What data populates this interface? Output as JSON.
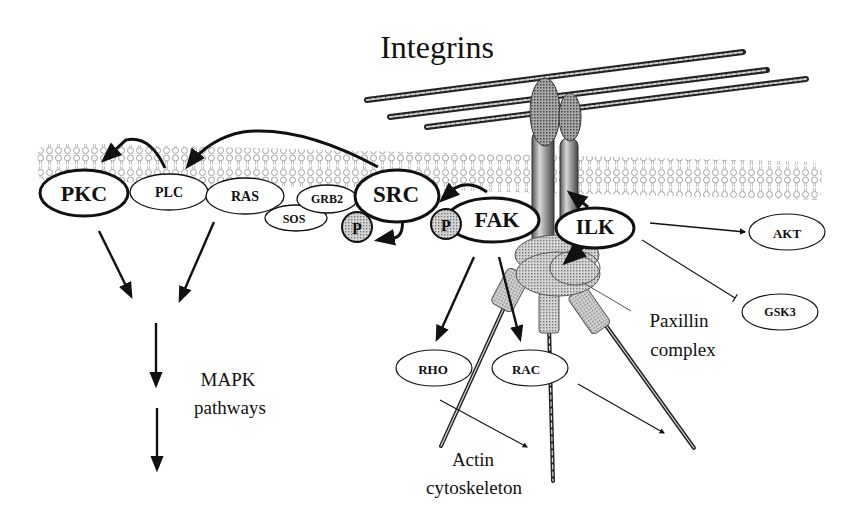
{
  "title": "Integrins",
  "colors": {
    "ink": "#111111",
    "membrane": "#9a9a9a",
    "phospho": "#bdbdbd",
    "integrin": "#8c8c8c",
    "paxillin": "#c9c9c9"
  },
  "membrane_nodes": {
    "pkc": "PKC",
    "plc": "PLC",
    "ras": "RAS",
    "sos": "SOS",
    "grb2": "GRB2",
    "src": "SRC",
    "fak": "FAK",
    "ilk": "ILK",
    "p1": "P",
    "p2": "P"
  },
  "downstream_nodes": {
    "akt": "AKT",
    "gsk3": "GSK3",
    "rho": "RHO",
    "rac": "RAC"
  },
  "labels": {
    "mapk_line1": "MAPK",
    "mapk_line2": "pathways",
    "paxillin_line1": "Paxillin",
    "paxillin_line2": "complex",
    "actin_line1": "Actin",
    "actin_line2": "cytoskeleton"
  },
  "edges": [
    {
      "from": "PLC",
      "to": "PKC",
      "type": "activation"
    },
    {
      "from": "SRC",
      "to": "PLC",
      "type": "activation"
    },
    {
      "from": "FAK",
      "to": "SRC",
      "type": "activation"
    },
    {
      "from": "SRC",
      "to": "P",
      "type": "phosphorylation"
    },
    {
      "from": "Integrins",
      "to": "ILK",
      "type": "activation"
    },
    {
      "from": "ILK",
      "to": "Paxillin complex",
      "type": "activation"
    },
    {
      "from": "ILK",
      "to": "AKT",
      "type": "activation"
    },
    {
      "from": "ILK",
      "to": "GSK3",
      "type": "inhibition"
    },
    {
      "from": "PKC",
      "to": "MAPK pathways",
      "type": "activation"
    },
    {
      "from": "RAS",
      "to": "MAPK pathways",
      "type": "activation"
    },
    {
      "from": "FAK",
      "to": "RHO",
      "type": "activation"
    },
    {
      "from": "FAK",
      "to": "RAC",
      "type": "activation"
    },
    {
      "from": "RHO",
      "to": "Actin cytoskeleton",
      "type": "activation"
    },
    {
      "from": "RAC",
      "to": "Actin cytoskeleton",
      "type": "activation"
    }
  ]
}
